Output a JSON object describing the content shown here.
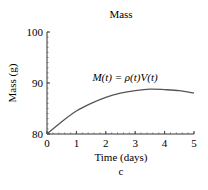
{
  "chart_data": {
    "type": "line",
    "title": "Mass",
    "xlabel": "Time (days)",
    "ylabel": "Mass (g)",
    "caption": "c",
    "annotation": "M(t) = ρ(t)V(t)",
    "xlim": [
      0,
      5
    ],
    "ylim": [
      80,
      100
    ],
    "x_ticks": [
      "0",
      "1",
      "2",
      "3",
      "4",
      "5"
    ],
    "y_ticks": [
      "80",
      "90",
      "100"
    ],
    "grid": false,
    "legend": null,
    "series": [
      {
        "name": "M(t)",
        "x": [
          0,
          0.5,
          1,
          1.5,
          2,
          2.5,
          3,
          3.5,
          4,
          4.5,
          5
        ],
        "values": [
          80.0,
          82.4,
          84.5,
          86.0,
          87.2,
          88.0,
          88.5,
          88.8,
          88.7,
          88.5,
          88.0
        ]
      }
    ],
    "line_color": "#555555"
  }
}
